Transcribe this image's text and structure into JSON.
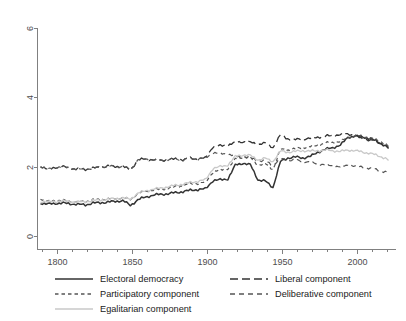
{
  "chart_data": {
    "type": "line",
    "title": "",
    "xlabel": "",
    "ylabel": "",
    "xlim": [
      1789,
      2021
    ],
    "ylim": [
      0,
      6
    ],
    "grid": false,
    "legend_position": "bottom",
    "x_ticks_major": [
      1800,
      1850,
      1900,
      1950,
      2000
    ],
    "x_ticks_major_labels": [
      "1800",
      "1850",
      "1900",
      "1950",
      "2000"
    ],
    "x_ticks_minor": [
      1790,
      1810,
      1820,
      1830,
      1840,
      1860,
      1870,
      1880,
      1890,
      1910,
      1920,
      1930,
      1940,
      1960,
      1970,
      1980,
      1990,
      2010,
      2020
    ],
    "y_ticks": [
      0,
      2,
      4,
      6
    ],
    "y_tick_labels": [
      "0",
      "2",
      "4",
      "6"
    ],
    "x": [
      1789,
      1794,
      1799,
      1804,
      1809,
      1814,
      1819,
      1824,
      1829,
      1834,
      1839,
      1844,
      1849,
      1854,
      1859,
      1864,
      1869,
      1874,
      1879,
      1884,
      1889,
      1894,
      1899,
      1904,
      1909,
      1914,
      1919,
      1924,
      1929,
      1934,
      1939,
      1944,
      1949,
      1954,
      1959,
      1964,
      1969,
      1974,
      1979,
      1984,
      1989,
      1994,
      1999,
      2004,
      2009,
      2014,
      2019,
      2021
    ],
    "series": [
      {
        "name": "Electoral democracy",
        "style": "solid",
        "color": "#333333",
        "width": 1.5,
        "values": [
          0.95,
          0.92,
          0.94,
          0.95,
          0.93,
          0.91,
          0.9,
          0.95,
          0.96,
          0.98,
          1.0,
          1.02,
          0.88,
          1.05,
          1.12,
          1.18,
          1.2,
          1.22,
          1.25,
          1.28,
          1.32,
          1.34,
          1.36,
          1.6,
          1.62,
          1.65,
          2.05,
          2.1,
          2.05,
          1.62,
          1.58,
          1.4,
          2.15,
          2.25,
          2.28,
          2.25,
          2.3,
          2.42,
          2.5,
          2.55,
          2.62,
          2.85,
          2.88,
          2.86,
          2.8,
          2.72,
          2.6,
          2.55
        ]
      },
      {
        "name": "Liberal component",
        "style": "longdash",
        "color": "#333333",
        "width": 1.3,
        "values": [
          2.02,
          1.92,
          1.98,
          2.0,
          1.95,
          1.93,
          1.92,
          1.96,
          1.98,
          2.02,
          2.0,
          2.01,
          1.9,
          2.2,
          2.22,
          2.2,
          2.18,
          2.2,
          2.22,
          2.2,
          2.24,
          2.22,
          2.25,
          2.58,
          2.6,
          2.62,
          2.7,
          2.72,
          2.7,
          2.65,
          2.68,
          2.55,
          2.92,
          2.8,
          2.78,
          2.8,
          2.82,
          2.85,
          2.88,
          2.9,
          2.92,
          2.95,
          2.88,
          2.8,
          2.76,
          2.7,
          2.6,
          2.52
        ]
      },
      {
        "name": "Participatory component",
        "style": "shortdash",
        "color": "#555555",
        "width": 1.2,
        "values": [
          1.08,
          1.0,
          1.02,
          1.03,
          1.0,
          0.99,
          1.0,
          1.04,
          1.05,
          1.07,
          1.08,
          1.1,
          1.05,
          1.22,
          1.28,
          1.32,
          1.35,
          1.38,
          1.42,
          1.45,
          1.5,
          1.52,
          1.55,
          1.85,
          1.9,
          1.95,
          2.22,
          2.28,
          2.26,
          2.05,
          2.08,
          1.92,
          2.5,
          2.48,
          2.52,
          2.55,
          2.58,
          2.62,
          2.68,
          2.7,
          2.72,
          2.86,
          2.9,
          2.88,
          2.82,
          2.76,
          2.66,
          2.58
        ]
      },
      {
        "name": "Deliberative component",
        "style": "meddash",
        "color": "#555555",
        "width": 1.2,
        "values": [
          2.02,
          1.92,
          1.98,
          2.0,
          1.95,
          1.93,
          1.92,
          1.96,
          1.98,
          2.02,
          2.0,
          2.01,
          1.9,
          2.2,
          2.22,
          2.2,
          2.18,
          2.2,
          2.22,
          2.2,
          2.24,
          2.22,
          2.25,
          2.4,
          2.38,
          2.36,
          2.3,
          2.28,
          2.26,
          2.18,
          2.15,
          2.05,
          2.22,
          2.2,
          2.18,
          2.16,
          2.12,
          2.08,
          2.05,
          2.02,
          2.0,
          2.04,
          2.02,
          1.98,
          1.95,
          1.9,
          1.85,
          1.82
        ]
      },
      {
        "name": "Egalitarian component",
        "style": "solid",
        "color": "#c8c8c8",
        "width": 1.3,
        "values": [
          1.0,
          0.98,
          1.0,
          1.01,
          0.99,
          0.98,
          0.99,
          1.02,
          1.04,
          1.06,
          1.08,
          1.1,
          1.06,
          1.24,
          1.3,
          1.35,
          1.38,
          1.42,
          1.46,
          1.5,
          1.54,
          1.58,
          1.62,
          1.95,
          2.0,
          2.05,
          2.3,
          2.34,
          2.32,
          2.2,
          2.24,
          2.15,
          2.45,
          2.42,
          2.44,
          2.46,
          2.45,
          2.46,
          2.48,
          2.46,
          2.44,
          2.48,
          2.46,
          2.42,
          2.38,
          2.32,
          2.24,
          2.18
        ]
      }
    ],
    "legend_entries": [
      {
        "label": "Electoral democracy",
        "style": "solid",
        "color": "#333333"
      },
      {
        "label": "Liberal component",
        "style": "longdash",
        "color": "#333333"
      },
      {
        "label": "Participatory component",
        "style": "shortdash",
        "color": "#555555"
      },
      {
        "label": "Deliberative component",
        "style": "meddash",
        "color": "#555555"
      },
      {
        "label": "Egalitarian component",
        "style": "solid",
        "color": "#c8c8c8"
      }
    ]
  }
}
